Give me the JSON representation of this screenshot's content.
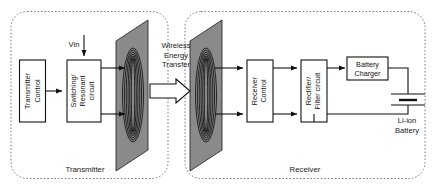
{
  "figure": {
    "colors": {
      "plane_fill": "#8a8a8a",
      "plane_stroke": "#2b2b2b",
      "coil_stroke": "#111111",
      "box_fill": "#ffffff",
      "box_stroke": "#111111",
      "wire": "#111111",
      "dashed_border": "#6e6e6e",
      "background": "#ffffff"
    }
  },
  "transmitter": {
    "section_label": "Transmitter",
    "input_label": "Vin",
    "blocks": [
      {
        "id": "transmitter-control",
        "line1": "Transmitter",
        "line2": "Control",
        "orientation": "vertical"
      },
      {
        "id": "switching-resonant-circuit",
        "line1": "Switching/",
        "line2": "Resonant",
        "line3": "circuit",
        "orientation": "vertical"
      }
    ],
    "coil_name": "transmitter-coil"
  },
  "transfer": {
    "label_line1": "Wireless",
    "label_line2": "Energy",
    "label_line3": "Transfer",
    "arrow_name": "wireless-energy-transfer-arrow"
  },
  "receiver": {
    "section_label": "Receiver",
    "blocks": [
      {
        "id": "receiver-control",
        "line1": "Receiver",
        "line2": "Control",
        "orientation": "vertical"
      },
      {
        "id": "rectifier-filter-circuit",
        "line1": "Rectifier/",
        "line2": "Filter circuit",
        "orientation": "vertical"
      },
      {
        "id": "battery-charger",
        "line1": "Battery",
        "line2": "Charger",
        "orientation": "horizontal"
      }
    ],
    "battery": {
      "label_line1": "Li-ion",
      "label_line2": "Battery"
    },
    "coil_name": "receiver-coil"
  }
}
